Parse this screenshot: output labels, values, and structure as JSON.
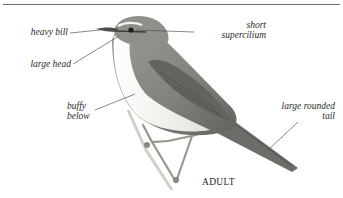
{
  "figure": {
    "caption": "ADULT",
    "colors": {
      "rule": "#6d6d6d",
      "upperparts": "#8a8d86",
      "underparts": "#f2f1ec",
      "wing_dark": "#5e605b",
      "leader_line": "#555555"
    }
  },
  "annotations": [
    {
      "id": "heavy-bill",
      "text": "heavy bill"
    },
    {
      "id": "large-head",
      "text": "large head"
    },
    {
      "id": "short-supercilium",
      "line1": "short",
      "line2": "supercilium"
    },
    {
      "id": "buffy-below",
      "line1": "buffy",
      "line2": "below"
    },
    {
      "id": "large-rounded-tail",
      "line1": "large rounded",
      "line2": "tail"
    }
  ]
}
